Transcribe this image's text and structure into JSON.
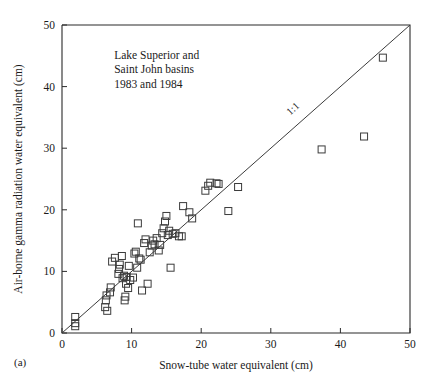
{
  "panel": {
    "label": "(a)"
  },
  "chart_data": {
    "type": "scatter",
    "title": "",
    "xlabel": "Snow-tube water equivalent (cm)",
    "ylabel": "Air-borne gamma radiation water equivalent (cm)",
    "xlim": [
      0,
      50
    ],
    "ylim": [
      0,
      50
    ],
    "xticks": [
      0,
      10,
      20,
      30,
      40,
      50
    ],
    "yticks": [
      0,
      10,
      20,
      30,
      40,
      50
    ],
    "grid": false,
    "legend": "none",
    "annotations": [
      {
        "name": "dataset-caption",
        "lines": [
          "Lake Superior and",
          "Saint John basins",
          "1983 and 1984"
        ],
        "x": 7.5,
        "y": 44.5
      },
      {
        "name": "reference-line-label",
        "text": "1:1",
        "x": 33.5,
        "y": 36.0,
        "rotation": -43
      }
    ],
    "reference_line": {
      "name": "1:1",
      "label": "1:1",
      "from": [
        0,
        0
      ],
      "to": [
        50,
        50
      ]
    },
    "marker": {
      "shape": "square-open",
      "size": 7,
      "edge_color": "#3b3b3b",
      "fill": "none"
    },
    "series": [
      {
        "name": "Basin snow water equivalent comparison",
        "points": [
          [
            1.9,
            2.6
          ],
          [
            1.9,
            1.6
          ],
          [
            1.9,
            1.1
          ],
          [
            6.2,
            4.2
          ],
          [
            6.3,
            5.3
          ],
          [
            6.4,
            6.1
          ],
          [
            6.5,
            3.6
          ],
          [
            6.9,
            6.6
          ],
          [
            7.0,
            7.4
          ],
          [
            7.2,
            11.6
          ],
          [
            7.6,
            12.2
          ],
          [
            8.1,
            9.6
          ],
          [
            8.2,
            10.4
          ],
          [
            8.3,
            11.1
          ],
          [
            8.6,
            12.5
          ],
          [
            8.7,
            8.9
          ],
          [
            8.9,
            9.3
          ],
          [
            9.0,
            5.3
          ],
          [
            9.1,
            5.9
          ],
          [
            9.2,
            8.0
          ],
          [
            9.3,
            9.1
          ],
          [
            9.5,
            7.3
          ],
          [
            9.6,
            10.9
          ],
          [
            9.8,
            8.6
          ],
          [
            10.2,
            9.0
          ],
          [
            10.4,
            12.9
          ],
          [
            10.6,
            13.2
          ],
          [
            10.8,
            10.6
          ],
          [
            10.9,
            17.8
          ],
          [
            11.1,
            12.1
          ],
          [
            11.3,
            11.9
          ],
          [
            11.5,
            6.9
          ],
          [
            11.8,
            14.6
          ],
          [
            12.0,
            15.2
          ],
          [
            12.3,
            8.0
          ],
          [
            12.6,
            13.1
          ],
          [
            12.9,
            14.2
          ],
          [
            13.1,
            15.0
          ],
          [
            13.3,
            14.4
          ],
          [
            13.6,
            15.4
          ],
          [
            13.9,
            13.4
          ],
          [
            14.1,
            14.3
          ],
          [
            14.4,
            16.2
          ],
          [
            14.6,
            17.0
          ],
          [
            14.8,
            18.1
          ],
          [
            15.0,
            19.0
          ],
          [
            15.2,
            15.9
          ],
          [
            15.4,
            16.6
          ],
          [
            15.6,
            10.6
          ],
          [
            15.9,
            16.1
          ],
          [
            16.3,
            16.2
          ],
          [
            16.8,
            15.7
          ],
          [
            17.2,
            15.7
          ],
          [
            17.4,
            20.6
          ],
          [
            18.3,
            19.6
          ],
          [
            18.7,
            18.6
          ],
          [
            20.6,
            23.1
          ],
          [
            21.0,
            23.9
          ],
          [
            21.3,
            24.4
          ],
          [
            22.2,
            24.3
          ],
          [
            22.5,
            24.2
          ],
          [
            23.9,
            19.8
          ],
          [
            25.3,
            23.7
          ],
          [
            37.3,
            29.8
          ],
          [
            43.4,
            31.9
          ],
          [
            46.1,
            44.7
          ]
        ]
      }
    ]
  }
}
